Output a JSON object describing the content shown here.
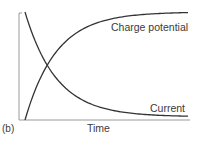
{
  "panel_label": "(b)",
  "chart_data": {
    "type": "line",
    "title": "",
    "xlabel": "Time",
    "ylabel": "",
    "grid": false,
    "legend": "inline labels on curves",
    "xlim": [
      0,
      1
    ],
    "ylim": [
      0,
      1
    ],
    "x": [
      0,
      0.05,
      0.1,
      0.15,
      0.2,
      0.3,
      0.4,
      0.5,
      0.6,
      0.7,
      0.8,
      0.9,
      1.0
    ],
    "series": [
      {
        "name": "Charge potential",
        "values": [
          0.0,
          0.33,
          0.52,
          0.65,
          0.74,
          0.85,
          0.91,
          0.94,
          0.96,
          0.97,
          0.98,
          0.985,
          0.99
        ],
        "label_position": "upper right, below curve"
      },
      {
        "name": "Current",
        "values": [
          1.0,
          0.67,
          0.48,
          0.35,
          0.26,
          0.15,
          0.09,
          0.06,
          0.04,
          0.03,
          0.02,
          0.015,
          0.01
        ],
        "label_position": "lower right, above curve"
      }
    ],
    "annotations": [
      "Curves intersect near Time ≈ 0.14, value ≈ 0.5"
    ],
    "colors": {
      "curves": "#333333",
      "axes": "#9a9a9a",
      "text": "#3a3a3a"
    }
  }
}
